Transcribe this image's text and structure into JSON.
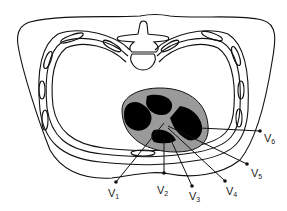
{
  "diagram": {
    "colors": {
      "outline": "#111111",
      "heart_wall": "#9a9a9a",
      "heart_chambers": "#000000",
      "background": "#ffffff"
    },
    "leads": [
      {
        "id": "V1",
        "letter": "V",
        "sub": "1",
        "dot": [
          116,
          182
        ],
        "label": [
          110,
          196
        ]
      },
      {
        "id": "V2",
        "letter": "V",
        "sub": "2",
        "dot": [
          164,
          173
        ],
        "label": [
          158,
          193
        ]
      },
      {
        "id": "V3",
        "letter": "V",
        "sub": "3",
        "dot": [
          192,
          186
        ],
        "label": [
          190,
          199
        ]
      },
      {
        "id": "V4",
        "letter": "V",
        "sub": "4",
        "dot": [
          225,
          181
        ],
        "label": [
          227,
          194
        ]
      },
      {
        "id": "V5",
        "letter": "V",
        "sub": "5",
        "dot": [
          247,
          164
        ],
        "label": [
          252,
          176
        ]
      },
      {
        "id": "V6",
        "letter": "V",
        "sub": "6",
        "dot": [
          260,
          131
        ],
        "label": [
          265,
          141
        ]
      }
    ]
  }
}
